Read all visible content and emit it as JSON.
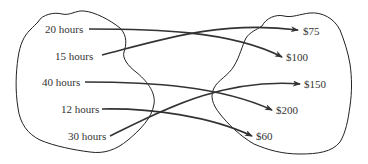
{
  "diagram": {
    "type": "mapping",
    "domain_set": {
      "items": [
        {
          "label": "20 hours",
          "x": 45,
          "y": 23
        },
        {
          "label": "15 hours",
          "x": 55,
          "y": 50
        },
        {
          "label": "40 hours",
          "x": 42,
          "y": 76
        },
        {
          "label": "12 hours",
          "x": 61,
          "y": 103
        },
        {
          "label": "30 hours",
          "x": 68,
          "y": 130
        }
      ]
    },
    "range_set": {
      "items": [
        {
          "label": "$75",
          "x": 303,
          "y": 25
        },
        {
          "label": "$100",
          "x": 286,
          "y": 51
        },
        {
          "label": "$150",
          "x": 304,
          "y": 78
        },
        {
          "label": "$200",
          "x": 276,
          "y": 104
        },
        {
          "label": "$60",
          "x": 256,
          "y": 130
        }
      ]
    },
    "mappings": [
      {
        "from": "20 hours",
        "to": "$100"
      },
      {
        "from": "15 hours",
        "to": "$75"
      },
      {
        "from": "40 hours",
        "to": "$200"
      },
      {
        "from": "12 hours",
        "to": "$60"
      },
      {
        "from": "30 hours",
        "to": "$150"
      }
    ],
    "colors": {
      "outline": "#222222",
      "arrow": "#333333",
      "text": "#333333",
      "background": "#ffffff"
    }
  }
}
